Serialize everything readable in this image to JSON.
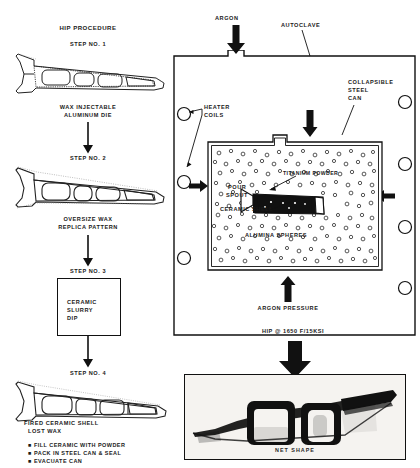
{
  "figure": {
    "left_column": {
      "title": "HIP PROCEDURE",
      "steps": [
        {
          "step_label": "STEP NO. 1",
          "caption_line1": "WAX INJECTABLE",
          "caption_line2": "ALUMINUM DIE",
          "icon": "airfoil-die-outline"
        },
        {
          "step_label": "STEP NO. 2",
          "caption_line1": "OVERSIZE WAX",
          "caption_line2": "REPLICA PATTERN",
          "icon": "airfoil-wax-pattern"
        },
        {
          "step_label": "STEP NO. 3",
          "box_line1": "CERAMIC",
          "box_line2": "SLURRY",
          "box_line3": "DIP",
          "icon": "process-box"
        },
        {
          "step_label": "STEP NO. 4",
          "caption_line1": "FIRED CERAMIC SHELL",
          "caption_line2": "LOST WAX",
          "icon": "airfoil-ceramic-shell",
          "bullets": [
            "FILL CERAMIC WITH POWDER",
            "PACK IN STEEL CAN & SEAL",
            "EVACUATE CAN"
          ]
        }
      ]
    },
    "autoclave": {
      "argon_inlet_label": "ARGON",
      "vessel_label": "AUTOCLAVE",
      "can_label_line1": "COLLAPSIBLE",
      "can_label_line2": "STEEL",
      "can_label_line3": "CAN",
      "heater_label_line1": "HEATER",
      "heater_label_line2": "COILS",
      "powder_label": "TITANIUM POWDER",
      "spout_label_line1": "POUR",
      "spout_label_line2": "SPOUT",
      "shell_label": "CERAMIC SHELL",
      "media_label": "ALUMINA SPHERES",
      "pressure_label": "ARGON PRESSURE",
      "conditions_label": "HIP @ 1650 F/15KSI",
      "heater_coil_count_left": 3,
      "heater_coil_count_right": 4
    },
    "result": {
      "caption": "NET SHAPE",
      "icon": "net-shape-photograph"
    },
    "colors": {
      "ink": "#111111",
      "paper": "#ffffff",
      "photo_bg": "#f2f0ed"
    }
  }
}
